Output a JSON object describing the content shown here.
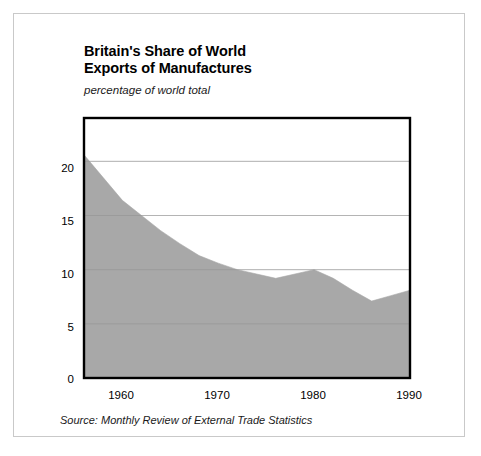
{
  "figure": {
    "title_line1": "Britain's Share of World",
    "title_line2": "Exports of Manufactures",
    "subtitle": "percentage of world total",
    "source": "Source: Monthly Review of External Trade Statistics",
    "background_color": "#ffffff",
    "border_color": "#c9c9c9",
    "plot_frame_color": "#000000",
    "fill_color": "#a8a8a8",
    "gridline_color": "#d9d9d9"
  },
  "axes": {
    "y_ticks": [
      "0",
      "5",
      "10",
      "15",
      "20"
    ],
    "x_ticks": [
      "1960",
      "1970",
      "1980",
      "1990"
    ]
  },
  "chart_data": {
    "type": "area",
    "title": "Britain's Share of World Exports of Manufactures",
    "subtitle": "percentage of world total",
    "xlabel": "",
    "ylabel": "percentage of world total",
    "xlim": [
      1956,
      1990
    ],
    "ylim": [
      0,
      24
    ],
    "y_ticks": [
      0,
      5,
      10,
      15,
      20
    ],
    "x_ticks": [
      1960,
      1970,
      1980,
      1990
    ],
    "grid": true,
    "legend": "none",
    "fill_color": "#a8a8a8",
    "series": [
      {
        "name": "Britain's share of world exports of manufactures",
        "x": [
          1956,
          1958,
          1960,
          1962,
          1964,
          1966,
          1968,
          1970,
          1972,
          1974,
          1976,
          1978,
          1980,
          1982,
          1984,
          1986,
          1988,
          1990
        ],
        "values": [
          20.6,
          18.5,
          16.4,
          15.0,
          13.6,
          12.4,
          11.3,
          10.6,
          10.0,
          9.6,
          9.2,
          9.6,
          10.0,
          9.2,
          8.1,
          7.1,
          7.6,
          8.1
        ]
      }
    ]
  }
}
